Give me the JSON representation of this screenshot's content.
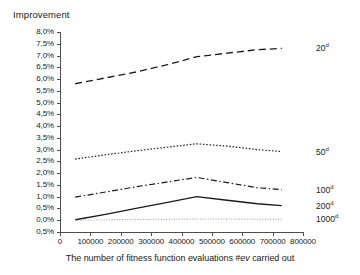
{
  "chart_data": {
    "type": "line",
    "title": "",
    "ylabel": "Improvement",
    "xlabel": "The number of fitness function evaluations #ev carried out",
    "xlabel_parts": {
      "before": "The number of fitness function evaluations ",
      "italic": "#ev",
      "after": " carried out"
    },
    "grid": false,
    "legend_position": "right-inline",
    "xlim": [
      0,
      800000
    ],
    "ylim": [
      -0.5,
      8.0
    ],
    "x_ticks": [
      0,
      100000,
      200000,
      300000,
      400000,
      500000,
      600000,
      700000,
      800000
    ],
    "x_tick_labels": [
      "0",
      "100000",
      "200000",
      "300000",
      "400000",
      "500000",
      "600000",
      "700000",
      "800000"
    ],
    "y_ticks": [
      8.0,
      7.5,
      7.0,
      6.5,
      6.0,
      5.5,
      5.0,
      4.5,
      4.0,
      3.5,
      3.0,
      2.5,
      2.0,
      1.5,
      1.0,
      0.5,
      0.0,
      -0.5
    ],
    "y_tick_labels": [
      "8,0%",
      "7,5%",
      "7,0%",
      "6,5%",
      "6,0%",
      "5,5%",
      "5,0%",
      "4,5%",
      "4,0%",
      "3,5%",
      "3,0%",
      "2,5%",
      "2,0%",
      "1,5%",
      "1,0%",
      "0,5%",
      "0,0%",
      "0,5%"
    ],
    "x": [
      50000,
      150000,
      250000,
      350000,
      450000,
      550000,
      650000,
      730000
    ],
    "series": [
      {
        "name": "20d",
        "label_text": "20",
        "label_sup": "d",
        "dash": "long-dash",
        "color": "#1a1a1a",
        "width": 1.3,
        "values": [
          5.8,
          6.05,
          6.3,
          6.6,
          6.95,
          7.1,
          7.25,
          7.3
        ]
      },
      {
        "name": "50d",
        "label_text": "50",
        "label_sup": "d",
        "dash": "dotted",
        "color": "#1a1a1a",
        "width": 1.2,
        "values": [
          2.6,
          2.78,
          2.95,
          3.1,
          3.25,
          3.15,
          3.0,
          2.92
        ]
      },
      {
        "name": "100d",
        "label_text": "100",
        "label_sup": "d",
        "dash": "dash-dot",
        "color": "#1a1a1a",
        "width": 1.2,
        "values": [
          0.98,
          1.2,
          1.42,
          1.62,
          1.82,
          1.6,
          1.38,
          1.3
        ]
      },
      {
        "name": "200d",
        "label_text": "200",
        "label_sup": "d",
        "dash": "solid",
        "color": "#1a1a1a",
        "width": 1.3,
        "values": [
          0.02,
          0.25,
          0.5,
          0.75,
          1.0,
          0.85,
          0.7,
          0.62
        ]
      },
      {
        "name": "1000d",
        "label_text": "1000",
        "label_sup": "d",
        "dash": "fine-dotted",
        "color": "#9a9a9a",
        "width": 1.0,
        "values": [
          0.0,
          0.02,
          0.03,
          0.04,
          0.05,
          0.05,
          0.04,
          0.04
        ]
      }
    ]
  }
}
